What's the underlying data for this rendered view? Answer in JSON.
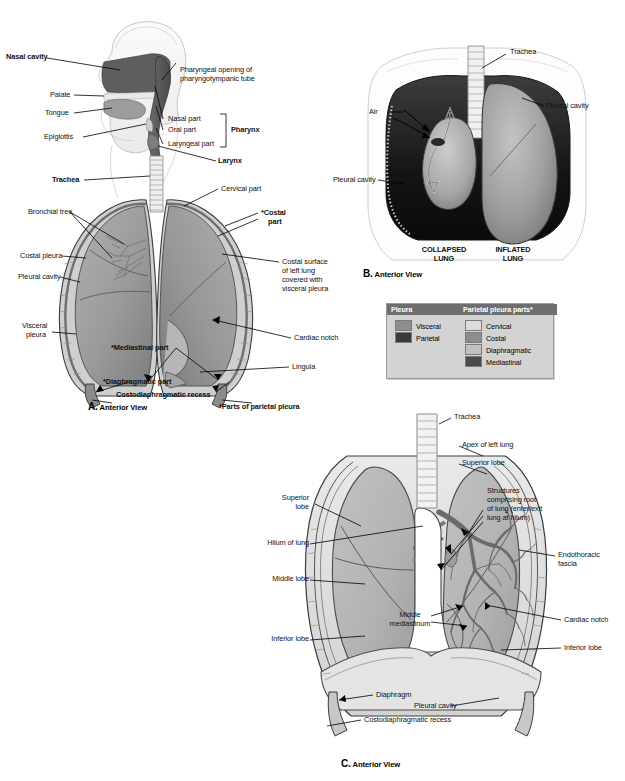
{
  "figure": {
    "footnote": "*Parts of parietal pleura"
  },
  "panels": {
    "a": {
      "letter": "A.",
      "caption": "Anterior View",
      "labels": [
        {
          "text": "Nasal cavity",
          "bold": true
        },
        {
          "text": "Pharyngeal opening of",
          "bold": false
        },
        {
          "text": "pharyngotympanic tube",
          "bold": false
        },
        {
          "text": "Palate",
          "bold": false
        },
        {
          "text": "Tongue",
          "bold": false
        },
        {
          "text": "Nasal part",
          "bold": false
        },
        {
          "text": "Oral part",
          "bold": false
        },
        {
          "text": "Epiglottis",
          "bold": false
        },
        {
          "text": "Laryngeal part",
          "bold": false
        },
        {
          "text": "Pharynx",
          "bold": true
        },
        {
          "text": "Larynx",
          "bold": true
        },
        {
          "text": "Trachea",
          "bold": true
        },
        {
          "text": "Cervical part",
          "bold": false
        },
        {
          "text": "Bronchial tree",
          "bold": false
        },
        {
          "text": "*Costal",
          "bold": true
        },
        {
          "text": "part",
          "bold": true
        },
        {
          "text": "Costal pleura",
          "bold": false
        },
        {
          "text": "Costal surface",
          "bold": false
        },
        {
          "text": "of left lung",
          "bold": false
        },
        {
          "text": "covered with",
          "bold": false
        },
        {
          "text": "visceral pleura",
          "bold": false
        },
        {
          "text": "Pleural cavity",
          "bold": false
        },
        {
          "text": "Cardiac notch",
          "bold": false
        },
        {
          "text": "Visceral",
          "bold": false
        },
        {
          "text": "pleura",
          "bold": false
        },
        {
          "text": "*Mediastinal part",
          "bold": true
        },
        {
          "text": "Lingula",
          "bold": false
        },
        {
          "text": "*Diaphragmatic part",
          "bold": true
        },
        {
          "text": "Costodiaphragmatic recess",
          "bold": true
        }
      ],
      "text": {
        "nasal_cavity": "Nasal cavity",
        "pharyngeal_opening_1": "Pharyngeal opening of",
        "pharyngeal_opening_2": "pharyngotympanic tube",
        "palate": "Palate",
        "tongue": "Tongue",
        "nasal_part": "Nasal part",
        "oral_part": "Oral part",
        "epiglottis": "Epiglottis",
        "laryngeal_part": "Laryngeal part",
        "pharynx": "Pharynx",
        "larynx": "Larynx",
        "trachea": "Trachea",
        "cervical_part": "Cervical part",
        "bronchial_tree": "Bronchial tree",
        "costal_part_1": "*Costal",
        "costal_part_2": "part",
        "costal_pleura": "Costal pleura",
        "costal_surface_1": "Costal surface",
        "costal_surface_2": "of left lung",
        "costal_surface_3": "covered with",
        "costal_surface_4": "visceral pleura",
        "pleural_cavity": "Pleural cavity",
        "cardiac_notch": "Cardiac notch",
        "visceral_1": "Visceral",
        "visceral_2": "pleura",
        "mediastinal_part": "*Mediastinal part",
        "lingula": "Lingula",
        "diaphragmatic_part": "*Diaphragmatic part",
        "costodiaphragmatic": "Costodiaphragmatic recess"
      }
    },
    "b": {
      "letter": "B.",
      "caption": "Anterior View",
      "text": {
        "trachea": "Trachea",
        "air": "Air",
        "pleural_cavity_right": "Pleural cavity",
        "pleural_cavity_left": "Pleural cavity",
        "collapsed_1": "COLLAPSED",
        "collapsed_2": "LUNG",
        "inflated_1": "INFLATED",
        "inflated_2": "LUNG"
      }
    },
    "c": {
      "letter": "C.",
      "caption": "Anterior View",
      "text": {
        "trachea": "Trachea",
        "apex_of_left_lung": "Apex of left lung",
        "superior_lobe_right": "Superior lobe",
        "superior_lobe_left_1": "Superior",
        "superior_lobe_left_2": "lobe",
        "structures_1": "Structures",
        "structures_2": "comprising root",
        "structures_3": "of lung (enter/exit",
        "structures_4": "lung at hilum)",
        "hilum_of_lung": "Hilum of lung",
        "endothoracic_1": "Endothoracic",
        "endothoracic_2": "fascia",
        "middle_lobe": "Middle lobe",
        "middle_mediastinum_1": "Middle",
        "middle_mediastinum_2": "mediastinum",
        "cardiac_notch": "Cardiac notch",
        "inferior_lobe_left": "Inferior lobe",
        "inferior_lobe_right": "Inferior lobe",
        "diaphragm": "Diaphragm",
        "pleural_cavity": "Pleural cavity",
        "costodiaphragmatic_recess": "Costodiaphragmatic recess"
      }
    }
  },
  "legend": {
    "header_left": "Pleura",
    "header_right": "Parietal pleura parts*",
    "left_items": [
      {
        "label": "Visceral",
        "color": "#8d8d8d"
      },
      {
        "label": "Parietal",
        "color": "#3a3a3a"
      }
    ],
    "right_items": [
      {
        "label": "Cervical",
        "color": "#dcdcdc"
      },
      {
        "label": "Costal",
        "color": "#8d8d8d"
      },
      {
        "label": "Diaphragmatic",
        "color": "#c2c2c2"
      },
      {
        "label": "Mediastinal",
        "color": "#4a4a4a"
      }
    ]
  },
  "colors": {
    "lung_mid": "#9a9a9a",
    "lung_light": "#b5b5b5",
    "dark_cavity": "#1e1e1e",
    "outline": "#2b2b2b",
    "legend_bg": "#d3d3d3",
    "legend_header": "#6e6e6e"
  }
}
